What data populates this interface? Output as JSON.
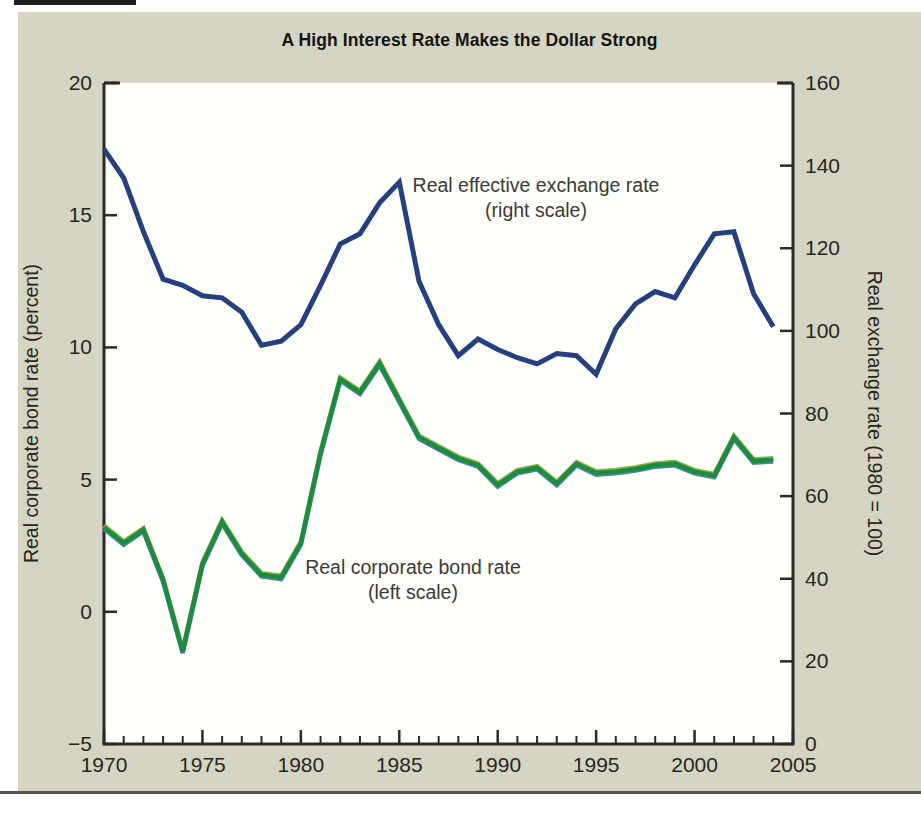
{
  "title": "A High Interest Rate Makes the Dollar Strong",
  "colors": {
    "page_bg": "#ffffff",
    "card_bg": "#d6d5c4",
    "plot_bg": "#fffffc",
    "axis": "#2b2a26",
    "tick_label": "#26251f",
    "annotation_text": "#3b3a34",
    "exchange_line": "#24407e",
    "bond_line": "#1f8a41",
    "bond_fringe_top": "#85b83d",
    "bond_fringe_bottom": "#4b86a8",
    "bottom_rule": "#55554b",
    "scan_bar": "#1d1d1b"
  },
  "chart_data": {
    "type": "line",
    "title": "A High Interest Rate Makes the Dollar Strong",
    "grid": false,
    "x": [
      1970,
      1971,
      1972,
      1973,
      1974,
      1975,
      1976,
      1977,
      1978,
      1979,
      1980,
      1981,
      1982,
      1983,
      1984,
      1985,
      1986,
      1987,
      1988,
      1989,
      1990,
      1991,
      1992,
      1993,
      1994,
      1995,
      1996,
      1997,
      1998,
      1999,
      2000,
      2001,
      2002,
      2003,
      2004
    ],
    "series": [
      {
        "name": "Real effective exchange rate",
        "axis": "right",
        "color": "#24407e",
        "values": [
          144,
          137,
          124,
          112.5,
          111,
          108.5,
          108,
          104.5,
          96.5,
          97.5,
          101.5,
          111,
          121,
          123.5,
          131,
          136,
          112,
          101.5,
          94,
          98,
          95.5,
          93.5,
          92,
          94.5,
          94,
          89.5,
          100.5,
          106.5,
          109.5,
          108,
          116,
          123.5,
          124,
          109,
          101
        ]
      },
      {
        "name": "Real corporate bond rate",
        "axis": "left",
        "color": "#1f8a41",
        "values": [
          3.2,
          2.6,
          3.1,
          1.2,
          -1.5,
          1.8,
          3.4,
          2.2,
          1.4,
          1.3,
          2.6,
          6.0,
          8.8,
          8.3,
          9.4,
          8.0,
          6.6,
          6.2,
          5.8,
          5.55,
          4.8,
          5.3,
          5.45,
          4.85,
          5.6,
          5.25,
          5.3,
          5.4,
          5.55,
          5.6,
          5.3,
          5.15,
          6.6,
          5.7,
          5.75
        ]
      }
    ],
    "left_axis": {
      "label": "Real corporate bond rate (percent)",
      "min": -5,
      "max": 20,
      "ticks": [
        20,
        15,
        10,
        5,
        0,
        -5
      ],
      "tick_labels": [
        "20",
        "15",
        "10",
        "5",
        "0",
        "−5"
      ]
    },
    "right_axis": {
      "label": "Real exchange rate (1980 = 100)",
      "min": 0,
      "max": 160,
      "ticks": [
        160,
        140,
        120,
        100,
        80,
        60,
        40,
        20,
        0
      ],
      "tick_labels": [
        "160",
        "140",
        "120",
        "100",
        "80",
        "60",
        "40",
        "20",
        "0"
      ]
    },
    "x_axis": {
      "min": 1970,
      "max": 2005,
      "minor_tick_every": 1,
      "major_ticks": [
        1970,
        1975,
        1980,
        1985,
        1990,
        1995,
        2000,
        2005
      ],
      "major_tick_labels": [
        "1970",
        "1975",
        "1980",
        "1985",
        "1990",
        "1995",
        "2000",
        "2005"
      ]
    },
    "annotations": [
      {
        "name": "exchange-rate-annotation",
        "lines": [
          "Real effective exchange rate",
          "(right scale)"
        ],
        "px": 536,
        "py": 192
      },
      {
        "name": "bond-rate-annotation",
        "lines": [
          "Real corporate bond rate",
          "(left scale)"
        ],
        "px": 413,
        "py": 574
      }
    ]
  }
}
